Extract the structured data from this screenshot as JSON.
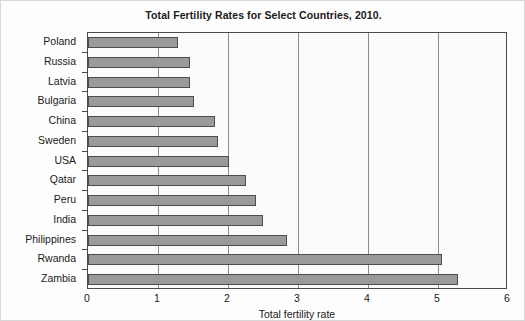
{
  "chart_data": {
    "type": "bar",
    "orientation": "horizontal",
    "title": "Total Fertility Rates for Select Countries, 2010.",
    "xlabel": "Total fertility rate",
    "ylabel": "",
    "xlim": [
      0,
      6
    ],
    "xticks": [
      "0",
      "1",
      "2",
      "3",
      "4",
      "5",
      "6"
    ],
    "grid": "vertical",
    "legend": null,
    "categories": [
      "Poland",
      "Russia",
      "Latvia",
      "Bulgaria",
      "China",
      "Sweden",
      "USA",
      "Qatar",
      "Peru",
      "India",
      "Philippines",
      "Rwanda",
      "Zambia"
    ],
    "values": [
      1.28,
      1.46,
      1.46,
      1.51,
      1.82,
      1.85,
      2.01,
      2.26,
      2.4,
      2.5,
      2.84,
      5.05,
      5.28
    ],
    "bar_color": "#9a9a9a",
    "bar_edge_color": "#4d4d4d",
    "plot_border_color": "#4a4a4a",
    "gridline_color": "#8c8c8c"
  }
}
